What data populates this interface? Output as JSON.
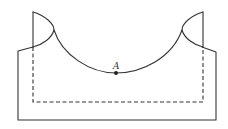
{
  "diagram": {
    "type": "geometric-figure",
    "point_label": "A",
    "colors": {
      "stroke": "#333333",
      "background": "#ffffff"
    }
  }
}
